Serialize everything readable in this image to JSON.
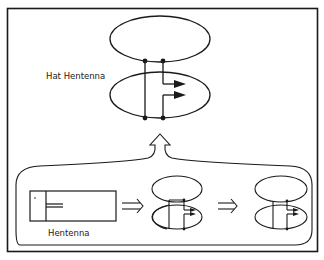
{
  "diagram": {
    "labels": {
      "hat_hentenna": "Hat Hentenna",
      "hentenna": "Hentenna"
    },
    "stages": [
      {
        "name": "hentenna",
        "shape": "rectangle-loop-with-feed"
      },
      {
        "name": "intermediate",
        "shape": "two-loops-offset-feed"
      },
      {
        "name": "near-final",
        "shape": "two-loops-feed"
      },
      {
        "name": "hat-hentenna",
        "shape": "two-ellipse-loops-with-feed-arrows"
      }
    ],
    "arrows": [
      "double-arrow-right",
      "double-arrow-right",
      "hollow-arrow-up"
    ],
    "colors": {
      "line": "#1a1a1a",
      "background": "#ffffff"
    }
  }
}
